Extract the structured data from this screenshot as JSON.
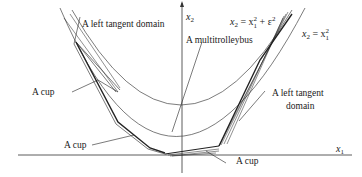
{
  "diagram": {
    "axes": {
      "x_label": "x",
      "x_sub": "1",
      "y_label": "x",
      "y_sub": "2"
    },
    "curves": {
      "outer": {
        "lhs": "x",
        "lhs_sub": "2",
        "eq": " = x",
        "sq": "2",
        "sub": "1"
      },
      "inner": {
        "lhs": "x",
        "lhs_sub": "2",
        "eq": " = x",
        "sq": "2",
        "sub": "1",
        "plus": " + ε",
        "eps_sq": "2"
      }
    },
    "annotations": [
      {
        "id": "left-tangent-domain-top",
        "text": "A left tangent domain"
      },
      {
        "id": "multitrolleybus",
        "text": "A multitrolleybus"
      },
      {
        "id": "cup-left-upper",
        "text": "A cup"
      },
      {
        "id": "cup-left-lower",
        "text": "A cup"
      },
      {
        "id": "cup-bottom",
        "text": "A cup"
      },
      {
        "id": "left-tangent-domain-right-1",
        "text": "A left tangent"
      },
      {
        "id": "left-tangent-domain-right-2",
        "text": "domain"
      }
    ]
  }
}
